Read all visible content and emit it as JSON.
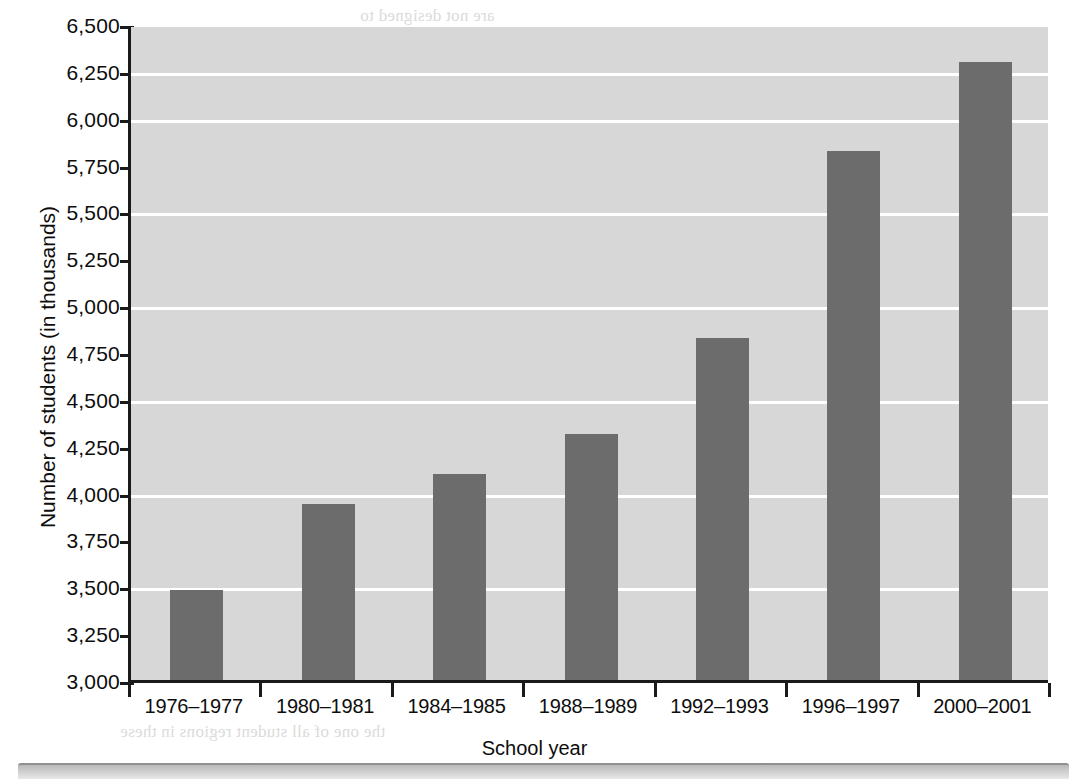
{
  "chart_data": {
    "type": "bar",
    "title": "",
    "xlabel": "School year",
    "ylabel": "Number of students (in thousands)",
    "categories": [
      "1976–1977",
      "1980–1981",
      "1984–1985",
      "1988–1989",
      "1992–1993",
      "1996–1997",
      "2000–2001"
    ],
    "values": [
      3480,
      3940,
      4100,
      4310,
      4825,
      5820,
      6300
    ],
    "ylim": [
      3000,
      6500
    ],
    "ytick_values": [
      3000,
      3250,
      3500,
      3750,
      4000,
      4250,
      4500,
      4750,
      5000,
      5250,
      5500,
      5750,
      6000,
      6250,
      6500
    ],
    "ytick_labels": [
      "3,000",
      "3,250",
      "3,500",
      "3,750",
      "4,000",
      "4,250",
      "4,500",
      "4,750",
      "5,000",
      "5,250",
      "5,500",
      "5,750",
      "6,000",
      "6,250",
      "6,500"
    ],
    "gridline_values": [
      3500,
      4000,
      4500,
      5000,
      5500,
      6000,
      6250
    ],
    "grid": true,
    "legend": "none",
    "bar_color": "#6c6c6c",
    "plot_background": "#d7d7d7",
    "gridline_color": "#ffffff",
    "axis_color": "#1a1a1a"
  },
  "bleed_text": [
    "are not designed to",
    "and are designed. Cleanly",
    "teachers and staff. The",
    "programs are compared to",
    "the table. (NCES, Census",
    "data, 2003)",
    "Starting these network have",
    "the classrooms have used for",
    "the purpose of instruction and",
    "types of technology that are for",
    "the available. The available does not resu",
    "in the resources for general education",
    "classrooms. Unfortunately not all",
    "of students. In and for the",
    "details and students. Classified",
    "quality, and reliability and",
    "classrooms in this state and",
    "including reduced in all states",
    "the one of all student regions in these"
  ]
}
